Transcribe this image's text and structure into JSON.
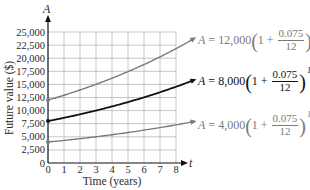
{
  "chart_data": {
    "type": "line",
    "title": "",
    "xlabel": "Time (years)",
    "ylabel": "Future value ($)",
    "x_axis_var": "t",
    "y_axis_var": "A",
    "xlim": [
      0,
      8
    ],
    "ylim": [
      0,
      25000
    ],
    "x_ticks": [
      "0",
      "1",
      "2",
      "3",
      "4",
      "5",
      "6",
      "7",
      "8"
    ],
    "y_ticks": [
      "0",
      "2,500",
      "5,000",
      "7,500",
      "10,000",
      "12,500",
      "15,000",
      "17,500",
      "20,000",
      "22,500",
      "25,000"
    ],
    "grid": true,
    "x": [
      0,
      1,
      2,
      3,
      4,
      5,
      6,
      7,
      8
    ],
    "series": [
      {
        "name": "A = 12,000(1 + 0.075/12)^(12t)",
        "principal": "12,000",
        "color": "#7a7a7a",
        "values": [
          12000,
          12931,
          13934,
          15015,
          16180,
          17435,
          18788,
          20246,
          21817
        ]
      },
      {
        "name": "A = 8,000(1 + 0.075/12)^(12t)",
        "principal": "8,000",
        "color": "#111111",
        "values": [
          8000,
          8621,
          9289,
          10010,
          10787,
          11623,
          12525,
          13497,
          14545
        ]
      },
      {
        "name": "A = 4,000(1 + 0.075/12)^(12t)",
        "principal": "4,000",
        "color": "#7a7a7a",
        "values": [
          4000,
          4310,
          4645,
          5005,
          5393,
          5812,
          6263,
          6749,
          7272
        ]
      }
    ],
    "annotations": [
      {
        "text": "A = 12,000(1 + 0.075/12)^(12t)",
        "position": "right of top curve"
      },
      {
        "text": "A = 8,000(1 + 0.075/12)^(12t)",
        "position": "right of middle curve"
      },
      {
        "text": "A = 4,000(1 + 0.075/12)^(12t)",
        "position": "right of bottom curve"
      }
    ],
    "legend_position": "inline labels on right"
  },
  "labels": {
    "A": "A",
    "equals": "=",
    "one_plus": "1 +",
    "rate_num": "0.075",
    "rate_den": "12",
    "exponent": "12t",
    "p_top": "12,000",
    "p_mid": "8,000",
    "p_bot": "4,000"
  }
}
